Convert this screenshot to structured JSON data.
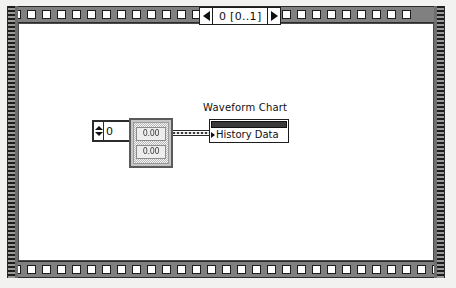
{
  "diagram": {
    "kind": "labview-block-diagram",
    "background_color": "#f2f2f0",
    "canvas_color": "#ffffff"
  },
  "loop": {
    "name": "for-loop-structure",
    "border_color": "#808080",
    "border_square_count_top_left": 13,
    "border_square_count_top_right": 14,
    "border_square_count_bottom": 29,
    "iteration_label": {
      "text": "0 [0..1]",
      "left_arrow": "left-triangle-icon",
      "right_arrow": "right-triangle-icon"
    }
  },
  "nodes": {
    "numeric_control": {
      "name": "numeric-index-control",
      "value": "0",
      "stepper_up": "increment-arrow-icon",
      "stepper_down": "decrement-arrow-icon"
    },
    "array_constant": {
      "name": "array-of-doubles",
      "cells": [
        "0.00",
        "0.00"
      ]
    },
    "wire": {
      "name": "array-data-wire",
      "type": "array",
      "color": "#3a3a3a"
    },
    "chart_terminal": {
      "caption": "Waveform Chart",
      "label": "History Data",
      "header_color": "#3a3a3a",
      "marker": "input-terminal-arrow-icon"
    }
  }
}
